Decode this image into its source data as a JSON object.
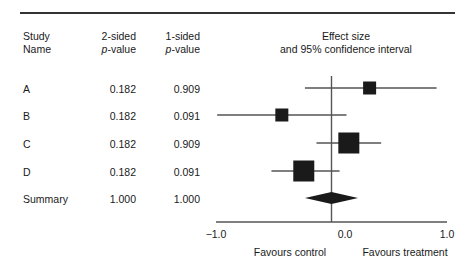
{
  "figure": {
    "name": "forest-plot-with-p-value-table"
  },
  "table": {
    "headers": {
      "study_name_line1": "Study",
      "study_name_line2": "Name",
      "two_sided_line1": "2-sided",
      "two_sided_line2_italic": "p",
      "two_sided_line2_rest": "-value",
      "one_sided_line1": "1-sided",
      "one_sided_line2_italic": "p",
      "one_sided_line2_rest": "-value"
    },
    "rows": [
      {
        "name": "A",
        "p_two_sided": "0.182",
        "p_one_sided": "0.909"
      },
      {
        "name": "B",
        "p_two_sided": "0.182",
        "p_one_sided": "0.091"
      },
      {
        "name": "C",
        "p_two_sided": "0.182",
        "p_one_sided": "0.909"
      },
      {
        "name": "D",
        "p_two_sided": "0.182",
        "p_one_sided": "0.091"
      },
      {
        "name": "Summary",
        "p_two_sided": "1.000",
        "p_one_sided": "1.000"
      }
    ]
  },
  "plot": {
    "title_line1": "Effect size",
    "title_line2": "and 95% confidence interval",
    "favours_left": "Favours control",
    "favours_right": "Favours treatment",
    "tick_labels": [
      "−1.0",
      "0.0",
      "1.0"
    ]
  },
  "chart_data": {
    "type": "forest",
    "title": "Effect size and 95% confidence interval",
    "xlabel": "",
    "ylabel": "",
    "xlim": [
      -1.0,
      1.0
    ],
    "xticks": [
      -1.0,
      0.0,
      1.0
    ],
    "xtick_labels": [
      "-1.0",
      "0.0",
      "1.0"
    ],
    "null_line": 0.0,
    "grid": false,
    "legend": "none",
    "left_annotation": "Favours control",
    "right_annotation": "Favours treatment",
    "marker_color": "#1a1a1a",
    "line_color": "#555555",
    "studies": [
      {
        "name": "A",
        "effect": 0.33,
        "ci_low": -0.23,
        "ci_high": 0.91,
        "p_two_sided": 0.182,
        "p_one_sided": 0.909,
        "marker": "square",
        "marker_size_px": 13,
        "is_summary": false
      },
      {
        "name": "B",
        "effect": -0.43,
        "ci_low": -0.99,
        "ci_high": 0.13,
        "p_two_sided": 0.182,
        "p_one_sided": 0.091,
        "marker": "square",
        "marker_size_px": 13,
        "is_summary": false
      },
      {
        "name": "C",
        "effect": 0.15,
        "ci_low": -0.13,
        "ci_high": 0.43,
        "p_two_sided": 0.182,
        "p_one_sided": 0.909,
        "marker": "square",
        "marker_size_px": 21,
        "is_summary": false
      },
      {
        "name": "D",
        "effect": -0.24,
        "ci_low": -0.52,
        "ci_high": 0.07,
        "p_two_sided": 0.182,
        "p_one_sided": 0.091,
        "marker": "square",
        "marker_size_px": 21,
        "is_summary": false
      },
      {
        "name": "Summary",
        "effect": 0.0,
        "ci_low": -0.23,
        "ci_high": 0.23,
        "p_two_sided": 1.0,
        "p_one_sided": 1.0,
        "marker": "diamond",
        "marker_size_px": 12,
        "is_summary": true
      }
    ]
  },
  "geometry": {
    "axis_x_left_px": 216,
    "axis_x_right_px": 447,
    "axis_y_px": 222,
    "null_x_px": 345,
    "row_y_px": [
      88,
      115,
      143,
      171,
      198
    ],
    "px_per_unit": 115.5
  }
}
